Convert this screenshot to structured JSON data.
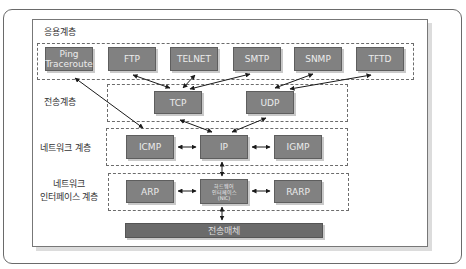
{
  "layers": {
    "application": {
      "label": "응용계층",
      "protocols": [
        {
          "line1": "Ping",
          "line2": "Traceroute"
        },
        {
          "line1": "FTP"
        },
        {
          "line1": "TELNET"
        },
        {
          "line1": "SMTP"
        },
        {
          "line1": "SNMP"
        },
        {
          "line1": "TFTD"
        }
      ]
    },
    "transport": {
      "label": "전송계층",
      "protocols": [
        "TCP",
        "UDP"
      ]
    },
    "network": {
      "label": "네트워크 계층",
      "protocols": [
        "ICMP",
        "IP",
        "IGMP"
      ]
    },
    "interface": {
      "label_line1": "네트워크",
      "label_line2": "인터페이스 계층",
      "protocols": [
        "ARP",
        "RARP"
      ],
      "hardware": {
        "line1": "하드웨어",
        "line2": "인터페이스",
        "line3": "(NIC)"
      }
    },
    "medium": {
      "label": "전송매체"
    }
  },
  "colors": {
    "box_fill": "#818181",
    "box_border": "#5e5e5e",
    "medium_fill": "#6b6b6b",
    "dash_border": "#6c6c6c",
    "arrow": "#1a1a1a"
  }
}
